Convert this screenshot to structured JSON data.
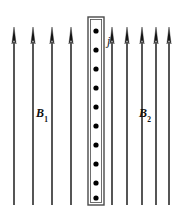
{
  "figure": {
    "background_color": "#ffffff",
    "stroke_color": "#2b2b2b",
    "dot_color": "#000000",
    "width": 175,
    "height": 218
  },
  "labels": {
    "b1": {
      "base": "B",
      "sub": "1",
      "x": 36,
      "y": 107
    },
    "b2": {
      "base": "B",
      "sub": "2",
      "x": 139,
      "y": 107
    },
    "j": {
      "base": "j",
      "sub": "",
      "x": 107,
      "y": 35
    }
  },
  "current_sheet": {
    "name": "current-sheet",
    "x": 88,
    "y": 17,
    "width": 16,
    "height": 188,
    "outline_color": "#4a4a4a",
    "fill_color": "#ffffff",
    "current_direction": "out-of-page",
    "dot_count": 10,
    "dot_radius": 2.6,
    "dot_positions_y": [
      31,
      50,
      69,
      88,
      107,
      126,
      145,
      164,
      183,
      198
    ]
  },
  "field_arrows": {
    "direction": "up",
    "tip_y": 27,
    "tail_y": 205,
    "head_width": 4.2,
    "head_length": 17,
    "shaft_width": 1.6,
    "left_group": {
      "name": "B1",
      "count": 4,
      "x_positions": [
        14,
        33,
        52,
        71
      ]
    },
    "right_group": {
      "name": "B2",
      "count": 5,
      "x_positions": [
        112,
        127,
        142,
        156,
        169
      ]
    }
  },
  "chart_data": {
    "type": "diagram",
    "elements": [
      {
        "name": "B1",
        "kind": "field-arrow-group",
        "label": "B1",
        "count": 4,
        "direction": "up",
        "side": "left"
      },
      {
        "name": "current-sheet",
        "kind": "rectangle",
        "label": "j",
        "symbol": "dot",
        "meaning": "current out of page",
        "dot_count": 10
      },
      {
        "name": "B2",
        "kind": "field-arrow-group",
        "label": "B2",
        "count": 5,
        "direction": "up",
        "side": "right"
      }
    ]
  }
}
